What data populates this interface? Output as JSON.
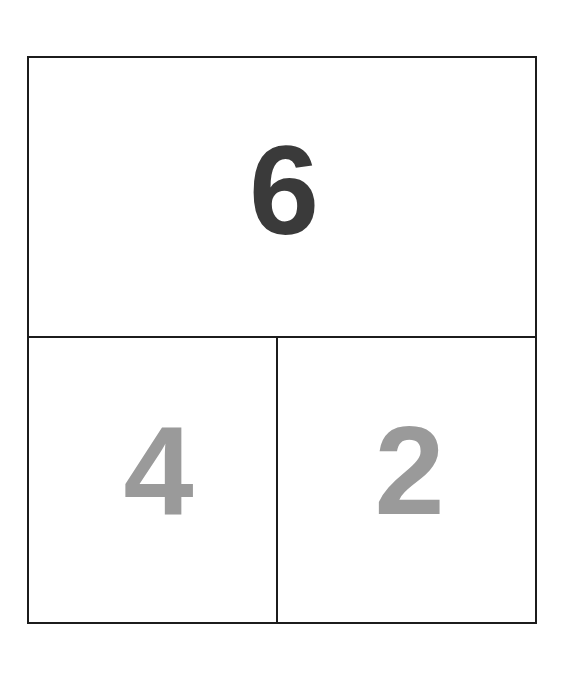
{
  "figure": {
    "background_color": "#ffffff",
    "border_color": "#1c1c1c",
    "border_width_px": 2,
    "regions": [
      {
        "name": "top",
        "label": "6",
        "color": "#3a3a3a",
        "position": "top-full-width"
      },
      {
        "name": "bottom-left",
        "label": "4",
        "color": "#9a9a9a",
        "position": "bottom-left"
      },
      {
        "name": "bottom-right",
        "label": "2",
        "color": "#9a9a9a",
        "position": "bottom-right"
      }
    ]
  }
}
